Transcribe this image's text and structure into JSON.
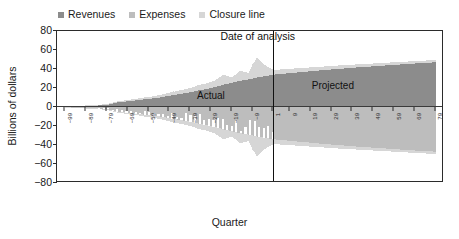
{
  "chart_data": {
    "type": "area",
    "title": "",
    "xlabel": "Quarter",
    "ylabel": "Billions of dollars",
    "ylim": [
      -80,
      80
    ],
    "xlim": [
      -103,
      83
    ],
    "grid": false,
    "legend_position": "top-left",
    "y_ticks": [
      80,
      60,
      40,
      20,
      0,
      -20,
      -40,
      -60,
      -80
    ],
    "y_tick_labels": [
      "80",
      "60",
      "40",
      "20",
      "0",
      "−20",
      "−40",
      "−60",
      "−80"
    ],
    "x_ticks": [
      -99,
      -89,
      -79,
      -69,
      -59,
      -49,
      -39,
      -29,
      -19,
      -9,
      1,
      9,
      19,
      29,
      39,
      49,
      59,
      69,
      79
    ],
    "x_tick_labels": [
      "−99",
      "−89",
      "−79",
      "−69",
      "−59",
      "−49",
      "−39",
      "−29",
      "−19",
      "−9",
      "1",
      "9",
      "19",
      "29",
      "39",
      "49",
      "59",
      "69",
      "79"
    ],
    "colors": {
      "revenues": "#8c8c8c",
      "expenses": "#bdbdbd",
      "closure_line": "#d6d6d6",
      "axis": "#2b2b2b",
      "annotation": "#111111"
    },
    "series": [
      {
        "name": "Revenues",
        "color": "#8c8c8c",
        "note": "area above zero, grows from ~0 at quarter -99 to ~47 at quarter 79",
        "x": [
          -99,
          -95,
          -91,
          -87,
          -83,
          -79,
          -75,
          -71,
          -67,
          -63,
          -59,
          -55,
          -51,
          -47,
          -43,
          -39,
          -35,
          -31,
          -27,
          -23,
          -19,
          -15,
          -11,
          -7,
          -3,
          1,
          5,
          9,
          13,
          17,
          21,
          25,
          29,
          33,
          37,
          41,
          45,
          49,
          53,
          57,
          61,
          65,
          69,
          73,
          79
        ],
        "values": [
          0.4,
          0.6,
          0.9,
          1.2,
          1.6,
          2.0,
          4.5,
          5.5,
          6.5,
          7.5,
          8.5,
          9.5,
          11.0,
          12.5,
          14.0,
          15.5,
          17.5,
          19.0,
          21.0,
          23.5,
          25.5,
          27.5,
          29.0,
          31.0,
          32.5,
          34.0,
          34.8,
          35.6,
          36.4,
          37.2,
          38.0,
          38.8,
          39.5,
          40.2,
          40.9,
          41.6,
          42.2,
          42.8,
          43.4,
          44.0,
          44.6,
          45.2,
          45.8,
          46.4,
          47.0
        ]
      },
      {
        "name": "Expenses",
        "color": "#bdbdbd",
        "note": "area below zero (plotted negative), mirrors revenue growth",
        "x": [
          -99,
          -95,
          -91,
          -87,
          -83,
          -79,
          -75,
          -71,
          -67,
          -63,
          -59,
          -55,
          -51,
          -47,
          -43,
          -39,
          -35,
          -31,
          -27,
          -23,
          -19,
          -15,
          -11,
          -7,
          -3,
          1,
          5,
          9,
          13,
          17,
          21,
          25,
          29,
          33,
          37,
          41,
          45,
          49,
          53,
          57,
          61,
          65,
          69,
          73,
          79
        ],
        "values": [
          -0.4,
          -0.6,
          -0.9,
          -1.2,
          -1.6,
          -2.0,
          -4.5,
          -5.5,
          -6.5,
          -7.5,
          -8.5,
          -9.5,
          -11.0,
          -12.5,
          -14.0,
          -15.5,
          -17.5,
          -19.0,
          -21.0,
          -23.5,
          -25.5,
          -27.5,
          -29.0,
          -31.0,
          -32.5,
          -34.0,
          -34.8,
          -35.6,
          -36.4,
          -37.2,
          -38.0,
          -38.8,
          -39.5,
          -40.2,
          -40.9,
          -41.6,
          -42.2,
          -42.8,
          -43.4,
          -44.0,
          -44.6,
          -45.2,
          -45.8,
          -46.4,
          -47.0
        ]
      },
      {
        "name": "Closure line",
        "color": "#d6d6d6",
        "note": "light band/spikes extending beyond revenue and expense envelopes; spiky in Actual period, smooth band in Projected period",
        "x": [
          -99,
          -95,
          -91,
          -87,
          -83,
          -79,
          -75,
          -71,
          -67,
          -63,
          -59,
          -55,
          -51,
          -47,
          -43,
          -39,
          -35,
          -31,
          -27,
          -23,
          -19,
          -15,
          -11,
          -7,
          -3,
          1,
          5,
          9,
          13,
          17,
          21,
          25,
          29,
          33,
          37,
          41,
          45,
          49,
          53,
          57,
          61,
          65,
          69,
          73,
          79
        ],
        "values": [
          0.6,
          1.0,
          1.4,
          1.8,
          2.4,
          3.0,
          5.5,
          6.8,
          8.0,
          9.2,
          10.5,
          12.0,
          14.0,
          16.0,
          18.0,
          20.0,
          23.0,
          25.0,
          28.0,
          34.0,
          31.0,
          38.0,
          36.0,
          52.0,
          44.0,
          39.0,
          39.6,
          40.2,
          40.8,
          41.4,
          42.0,
          42.6,
          43.2,
          43.8,
          44.3,
          44.8,
          45.3,
          45.8,
          46.3,
          46.8,
          47.3,
          47.8,
          48.3,
          48.8,
          49.4
        ]
      }
    ],
    "annotations": [
      {
        "name": "date-of-analysis",
        "text": "Date of analysis",
        "x": 1,
        "type": "vertical-line-label"
      },
      {
        "name": "actual",
        "text": "Actual",
        "x": -28,
        "y": 12,
        "type": "region-label"
      },
      {
        "name": "projected",
        "text": "Projected",
        "x": 30,
        "y": 22,
        "type": "region-label"
      }
    ]
  },
  "legend": {
    "entries": [
      {
        "label": "Revenues",
        "color": "#8c8c8c",
        "icon": "square-marker"
      },
      {
        "label": "Expenses",
        "color": "#bdbdbd",
        "icon": "square-marker"
      },
      {
        "label": "Closure line",
        "color": "#d6d6d6",
        "icon": "square-marker"
      }
    ]
  },
  "axes": {
    "y_title": "Billions of dollars",
    "x_title": "Quarter"
  },
  "annotations": {
    "date_of_analysis": "Date of analysis",
    "actual": "Actual",
    "projected": "Projected"
  }
}
